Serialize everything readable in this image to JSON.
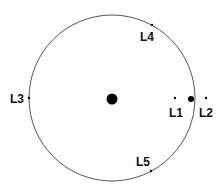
{
  "bodies": [
    {
      "name": "sun",
      "role": "primary"
    },
    {
      "name": "earth",
      "role": "secondary"
    }
  ],
  "points": [
    {
      "id": "L1",
      "label": "L1"
    },
    {
      "id": "L2",
      "label": "L2"
    },
    {
      "id": "L3",
      "label": "L3"
    },
    {
      "id": "L4",
      "label": "L4"
    },
    {
      "id": "L5",
      "label": "L5"
    }
  ],
  "colors": {
    "stroke": "#555555",
    "fill": "#000000",
    "text": "#111111"
  }
}
